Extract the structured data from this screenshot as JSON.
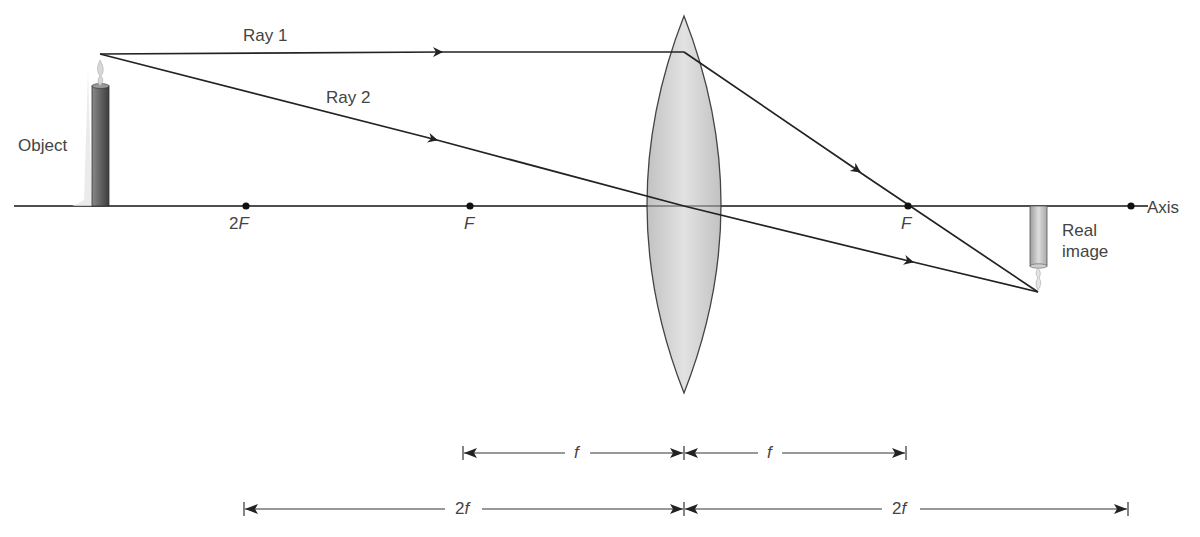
{
  "diagram": {
    "type": "ray-diagram-converging-lens",
    "labels": {
      "ray1": "Ray 1",
      "ray2": "Ray 2",
      "object": "Object",
      "axis": "Axis",
      "real_image_line1": "Real",
      "real_image_line2": "image",
      "focal_2F_left": "2F",
      "focal_F_left": "F",
      "focal_F_right": "F"
    },
    "focal_2F_left": {
      "num": "2",
      "letter": "F"
    },
    "dimensions": {
      "f_left": "f",
      "f_right": "f",
      "twof_left": {
        "num": "2",
        "letter": "f"
      },
      "twof_right": {
        "num": "2",
        "letter": "f"
      }
    },
    "geometry": {
      "axis_y": 206,
      "lens_x": 684,
      "lens_top_y": 16,
      "lens_bottom_y": 393,
      "object_x": 100,
      "object_top_y": 54,
      "image_x": 1038,
      "image_bottom_y": 292,
      "points_x": {
        "2F_left": 246,
        "F_left": 470,
        "F_right": 908,
        "2F_right": 1131
      }
    },
    "colors": {
      "line": "#222222",
      "lens_fill": "#d4d4d4",
      "text": "#444444",
      "candle_dark": "#6e6e6e",
      "candle_light": "#bdbdbd"
    }
  }
}
